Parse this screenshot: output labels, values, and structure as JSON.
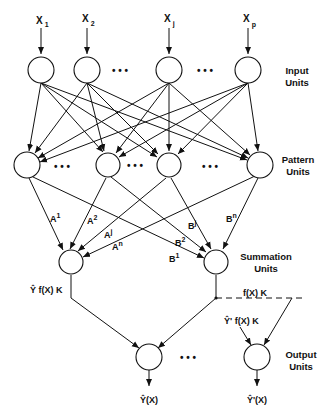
{
  "diagram": {
    "inputs": [
      {
        "label": "X",
        "sub": "1"
      },
      {
        "label": "X",
        "sub": "2"
      },
      {
        "label": "X",
        "sub": "j"
      },
      {
        "label": "X",
        "sub": "p"
      }
    ],
    "layers": {
      "input": {
        "line1": "Input",
        "line2": "Units"
      },
      "pattern": {
        "line1": "Pattern",
        "line2": "Units"
      },
      "summation": {
        "line1": "Summation",
        "line2": "Units"
      },
      "output": {
        "line1": "Output",
        "line2": "Units"
      }
    },
    "weights_A": [
      {
        "base": "A",
        "sup": "1"
      },
      {
        "base": "A",
        "sup": "2"
      },
      {
        "base": "A",
        "sup": "j"
      },
      {
        "base": "A",
        "sup": "n"
      }
    ],
    "weights_B": [
      {
        "base": "B",
        "sup": "1"
      },
      {
        "base": "B",
        "sup": "2"
      },
      {
        "base": "B",
        "sup": "j"
      },
      {
        "base": "B",
        "sup": "n"
      }
    ],
    "summation_labels": {
      "left": "Ŷ f(X) K",
      "right": "f(X) K",
      "output2_in": "Ŷ' f(X) K"
    },
    "outputs": [
      {
        "label": "Ŷ(X)"
      },
      {
        "label": "Ŷ'(X)"
      }
    ],
    "ellipsis": "• • •"
  }
}
